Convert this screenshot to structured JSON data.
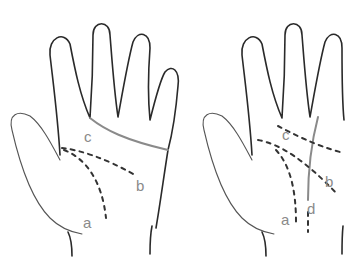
{
  "figure": {
    "panels": [
      {
        "id": "left-hand",
        "labels": {
          "a": "a",
          "b": "b",
          "c": "c"
        },
        "lines": {
          "c": "solid",
          "a": "dashed",
          "b": "dashed"
        }
      },
      {
        "id": "right-hand",
        "labels": {
          "a": "a",
          "b": "b",
          "c": "c",
          "d": "d"
        },
        "lines": {
          "a": "dashed",
          "b": "dashed",
          "c": "dashed",
          "d": "solid"
        }
      }
    ],
    "colors": {
      "outline": "#2a2a2a",
      "label": "#8a8a8a",
      "solid_line": "#8a8a8a",
      "dashed_line": "#333333"
    }
  }
}
